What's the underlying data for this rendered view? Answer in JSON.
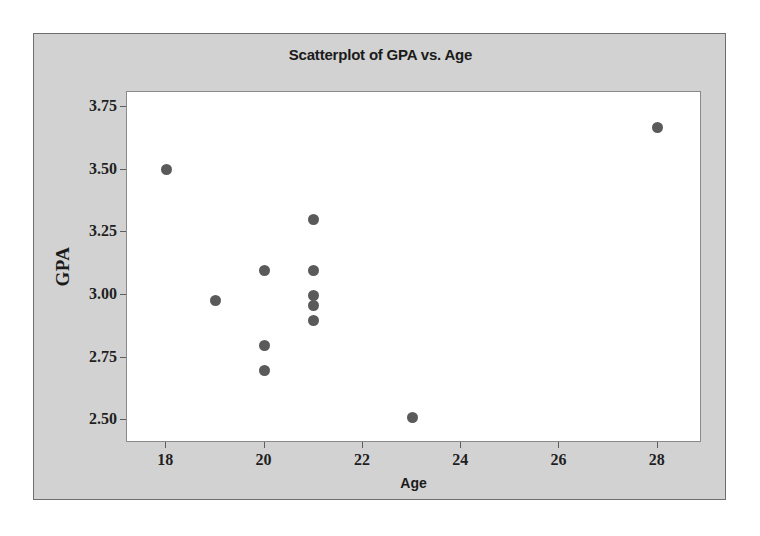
{
  "figure": {
    "background_color": "#ffffff",
    "panel_color": "#d2d2d2",
    "plot_color": "#ffffff",
    "marker_color": "#5a5a5a",
    "axis_color": "#5e5e5e",
    "text_color": "#1b1b1b"
  },
  "chart_data": {
    "type": "scatter",
    "title": "Scatterplot of GPA vs. Age",
    "xlabel": "Age",
    "ylabel": "GPA",
    "xlim": [
      17.2,
      28.9
    ],
    "ylim": [
      2.41,
      3.81
    ],
    "xticks": [
      18,
      20,
      22,
      24,
      26,
      28
    ],
    "xtick_labels": [
      "18",
      "20",
      "22",
      "24",
      "26",
      "28"
    ],
    "yticks": [
      2.5,
      2.75,
      3.0,
      3.25,
      3.5,
      3.75
    ],
    "ytick_labels": [
      "2.50",
      "2.75",
      "3.00",
      "3.25",
      "3.50",
      "3.75"
    ],
    "grid": false,
    "legend": null,
    "series": [
      {
        "name": "Students",
        "marker": "circle",
        "color": "#5a5a5a",
        "points": [
          {
            "x": 18,
            "y": 3.5
          },
          {
            "x": 19,
            "y": 2.98
          },
          {
            "x": 20,
            "y": 3.1
          },
          {
            "x": 20,
            "y": 2.8
          },
          {
            "x": 20,
            "y": 2.7
          },
          {
            "x": 21,
            "y": 3.3
          },
          {
            "x": 21,
            "y": 3.1
          },
          {
            "x": 21,
            "y": 3.0
          },
          {
            "x": 21,
            "y": 2.96
          },
          {
            "x": 21,
            "y": 2.9
          },
          {
            "x": 23,
            "y": 2.51
          },
          {
            "x": 28,
            "y": 3.67
          }
        ]
      }
    ]
  }
}
